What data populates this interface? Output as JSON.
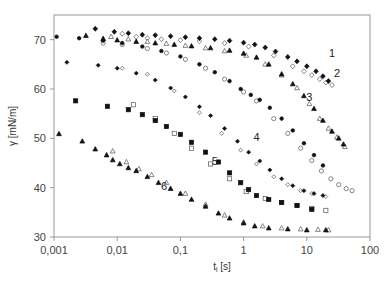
{
  "chart_data": {
    "type": "scatter",
    "title": "",
    "xlabel": "t_l [s]",
    "xlabel_main": "t",
    "xlabel_sub": "l",
    "xlabel_unit": " [s]",
    "ylabel": "γ [mN/m]",
    "xscale": "log",
    "xlim": [
      0.001,
      100
    ],
    "ylim": [
      30,
      75
    ],
    "xticks": [
      0.001,
      0.01,
      0.1,
      1,
      10,
      100
    ],
    "xtick_labels": [
      "0,001",
      "0,01",
      "0,1",
      "1",
      "10",
      "100"
    ],
    "yticks": [
      30,
      40,
      50,
      60,
      70
    ],
    "ytick_labels": [
      "30",
      "40",
      "50",
      "60",
      "70"
    ],
    "grid": false,
    "legend": "none (curves numbered 1–6 inline)",
    "series": [
      {
        "name": "1",
        "marker": "diamond",
        "label_pos": {
          "x": 25,
          "y": 66.5
        },
        "filled": {
          "x": [
            0.0045,
            0.009,
            0.015,
            0.025,
            0.04,
            0.07,
            0.12,
            0.2,
            0.35,
            0.6,
            1.0,
            1.5,
            2.2,
            3.2,
            5,
            7,
            10,
            14,
            18,
            22
          ],
          "y": [
            72.2,
            71.6,
            71.3,
            71.0,
            70.9,
            70.7,
            70.5,
            70.3,
            70.1,
            69.8,
            69.4,
            69.0,
            68.4,
            67.6,
            66.5,
            65.6,
            64.6,
            63.6,
            62.6,
            61.6
          ]
        },
        "open": {
          "x": [
            0.012,
            0.02,
            0.03,
            0.05,
            0.1,
            0.2,
            0.5,
            1.2,
            3,
            6,
            9,
            12,
            16,
            20,
            25
          ],
          "y": [
            71.2,
            70.6,
            70.3,
            70.1,
            69.9,
            69.7,
            69.3,
            68.6,
            66.8,
            64.6,
            63.6,
            62.8,
            62.0,
            61.3,
            60.8
          ]
        }
      },
      {
        "name": "2",
        "marker": "triangle",
        "label_pos": {
          "x": 30,
          "y": 62.5
        },
        "filled": {
          "x": [
            0.0032,
            0.006,
            0.01,
            0.02,
            0.04,
            0.08,
            0.15,
            0.3,
            0.6,
            1.0,
            1.6,
            2.5,
            4,
            6,
            9,
            13,
            18,
            25,
            32,
            38
          ],
          "y": [
            70.8,
            70.2,
            69.9,
            69.6,
            69.3,
            69.0,
            68.7,
            68.3,
            67.8,
            67.2,
            66.4,
            65.0,
            63.0,
            61.0,
            58.6,
            56.0,
            53.6,
            51.4,
            50.0,
            48.8
          ]
        },
        "open": {
          "x": [
            0.008,
            0.015,
            0.03,
            0.06,
            0.12,
            0.25,
            0.5,
            1.1,
            2.2,
            4,
            7,
            11,
            16,
            22,
            30,
            40
          ],
          "y": [
            70.6,
            70.1,
            69.6,
            69.2,
            68.8,
            68.3,
            67.7,
            66.8,
            65.0,
            62.8,
            60.2,
            57.0,
            54.0,
            52.0,
            50.2,
            48.3
          ]
        }
      },
      {
        "name": "3",
        "marker": "circle",
        "label_pos": {
          "x": 11,
          "y": 57.5
        },
        "filled": {
          "x": [
            0.0011,
            0.0025,
            0.006,
            0.012,
            0.025,
            0.05,
            0.1,
            0.2,
            0.35,
            0.6,
            0.9,
            1.3,
            1.8,
            2.6,
            4,
            6,
            9,
            13,
            18
          ],
          "y": [
            70.6,
            70.3,
            69.8,
            69.3,
            68.6,
            67.7,
            66.6,
            65.0,
            63.4,
            61.6,
            60.0,
            58.8,
            57.8,
            56.2,
            54.0,
            51.6,
            49.0,
            46.6,
            44.5
          ]
        },
        "open": {
          "x": [
            0.006,
            0.012,
            0.03,
            0.06,
            0.12,
            0.25,
            0.5,
            1.0,
            1.6,
            3,
            5,
            8,
            12,
            17,
            24,
            32,
            42,
            52
          ],
          "y": [
            69.3,
            69.0,
            68.2,
            67.3,
            66.0,
            64.2,
            62.0,
            59.4,
            57.6,
            54.0,
            51.0,
            48.0,
            45.5,
            43.4,
            41.8,
            40.6,
            39.8,
            39.4
          ]
        }
      },
      {
        "name": "4",
        "marker": "diamond-small",
        "label_pos": {
          "x": 1.6,
          "y": 49.5
        },
        "filled": {
          "x": [
            0.0016,
            0.005,
            0.01,
            0.02,
            0.04,
            0.07,
            0.12,
            0.2,
            0.3,
            0.5,
            0.8,
            1.2,
            1.8,
            2.6,
            4,
            6,
            9,
            13,
            18
          ],
          "y": [
            65.4,
            64.8,
            64.2,
            63.2,
            61.8,
            60.2,
            58.4,
            56.4,
            54.6,
            52.0,
            49.4,
            47.2,
            45.4,
            43.6,
            41.8,
            40.4,
            39.4,
            38.8,
            38.4
          ]
        },
        "open": {
          "x": [
            0.012,
            0.03,
            0.08,
            0.2,
            0.45,
            0.9,
            1.6,
            3,
            5,
            8,
            12,
            20
          ],
          "y": [
            64.2,
            63.0,
            59.6,
            55.2,
            51.0,
            47.6,
            44.8,
            42.2,
            40.6,
            39.4,
            38.8,
            38.2
          ]
        }
      },
      {
        "name": "5",
        "marker": "square",
        "label_pos": {
          "x": 0.35,
          "y": 44.5
        },
        "filled": {
          "x": [
            0.0022,
            0.007,
            0.015,
            0.025,
            0.04,
            0.06,
            0.1,
            0.15,
            0.25,
            0.4,
            0.6,
            0.9,
            1.2,
            1.6,
            2.5,
            4,
            7,
            12
          ],
          "y": [
            57.6,
            56.5,
            55.8,
            54.8,
            53.6,
            52.4,
            50.8,
            49.2,
            47.2,
            45.2,
            43.0,
            41.0,
            39.6,
            38.4,
            37.6,
            37.0,
            36.4,
            35.6
          ]
        },
        "open": {
          "x": [
            0.018,
            0.04,
            0.08,
            0.15,
            0.3,
            0.6,
            1.1,
            2.2,
            4,
            7,
            12,
            20
          ],
          "y": [
            56.8,
            54.0,
            51.0,
            48.0,
            44.8,
            41.8,
            39.2,
            37.8,
            37.0,
            36.4,
            35.8,
            35.4
          ]
        }
      },
      {
        "name": "6",
        "marker": "triangle",
        "label_pos": {
          "x": 0.055,
          "y": 39.5
        },
        "filled": {
          "x": [
            0.0012,
            0.0028,
            0.0045,
            0.0068,
            0.0085,
            0.011,
            0.015,
            0.02,
            0.03,
            0.045,
            0.07,
            0.1,
            0.15,
            0.25,
            0.4,
            0.6,
            1.0,
            1.5,
            2.5,
            5,
            10,
            20
          ],
          "y": [
            50.9,
            49.4,
            47.8,
            46.6,
            45.6,
            44.8,
            44.0,
            43.4,
            42.2,
            41.0,
            39.8,
            38.8,
            37.6,
            36.2,
            34.8,
            33.8,
            32.8,
            32.2,
            31.8,
            31.6,
            31.4,
            31.4
          ]
        },
        "open": {
          "x": [
            0.0085,
            0.014,
            0.022,
            0.035,
            0.06,
            0.12,
            0.25,
            0.5,
            1.0,
            2,
            4,
            8,
            15,
            22
          ],
          "y": [
            47.4,
            45.2,
            43.8,
            42.6,
            41.0,
            38.8,
            36.6,
            34.4,
            33.0,
            32.2,
            31.8,
            31.6,
            31.5,
            31.4
          ]
        }
      }
    ]
  },
  "plot_area": {
    "left": 54,
    "top": 15,
    "right": 370,
    "bottom": 237
  }
}
